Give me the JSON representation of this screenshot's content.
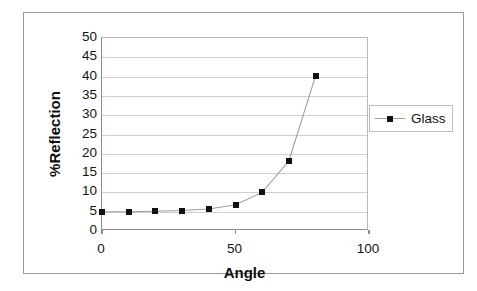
{
  "chart_data": {
    "type": "scatter",
    "title": "",
    "xlabel": "Angle",
    "ylabel": "%Reflection",
    "xlim": [
      0,
      100
    ],
    "ylim": [
      0,
      50
    ],
    "xticks": [
      "0",
      "50",
      "100"
    ],
    "xtick_values": [
      0,
      50,
      100
    ],
    "yticks": [
      "0",
      "5",
      "10",
      "15",
      "20",
      "25",
      "30",
      "35",
      "40",
      "45",
      "50"
    ],
    "ytick_values": [
      0,
      5,
      10,
      15,
      20,
      25,
      30,
      35,
      40,
      45,
      50
    ],
    "grid": "horizontal",
    "legend_position": "right",
    "series": [
      {
        "name": "Glass",
        "marker": "square",
        "marker_color": "#111111",
        "line_color": "#9e9e9e",
        "x": [
          0,
          10,
          20,
          30,
          40,
          50,
          60,
          70,
          80
        ],
        "values": [
          5.0,
          5.0,
          5.1,
          5.3,
          5.7,
          6.8,
          10.0,
          18.2,
          40.2
        ]
      }
    ]
  },
  "legend": {
    "entries": [
      {
        "label": "Glass"
      }
    ]
  },
  "axes": {
    "x_title": "Angle",
    "y_title": "%Reflection"
  }
}
